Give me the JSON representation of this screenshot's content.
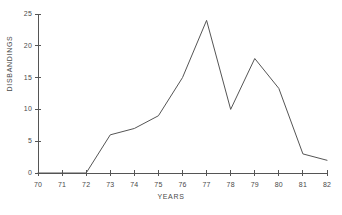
{
  "chart_data": {
    "type": "line",
    "title": "",
    "subtitle": "",
    "xlabel": "YEARS",
    "ylabel": "DISBANDINGS",
    "x": [
      70,
      71,
      72,
      73,
      74,
      75,
      76,
      77,
      78,
      79,
      80,
      81,
      82
    ],
    "values": [
      0,
      0,
      0,
      6,
      7,
      9,
      15,
      24,
      10,
      18,
      13.3,
      3,
      2
    ],
    "series": [
      {
        "name": "Disbandings",
        "values": [
          0,
          0,
          0,
          6,
          7,
          9,
          15,
          24,
          10,
          18,
          13.3,
          3,
          2
        ]
      }
    ],
    "xtick_labels": [
      "70",
      "71",
      "72",
      "73",
      "74",
      "75",
      "76",
      "77",
      "78",
      "79",
      "80",
      "81",
      "82"
    ],
    "ytick_labels": [
      "0",
      "5",
      "10",
      "15",
      "20",
      "25"
    ],
    "ytick_values": [
      0,
      5,
      10,
      15,
      20,
      25
    ],
    "xlim": [
      70,
      82
    ],
    "ylim": [
      0,
      25
    ],
    "grid": false,
    "legend": false,
    "legend_position": "none",
    "markers": false,
    "line_color": "#555555",
    "axis_color": "#555555",
    "background_color": "#ffffff",
    "annotations": []
  }
}
